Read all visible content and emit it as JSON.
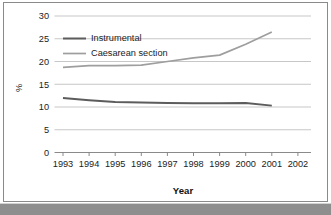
{
  "chart_data": {
    "type": "line",
    "title": "",
    "xlabel": "Year",
    "ylabel": "%",
    "x": [
      1993,
      1994,
      1995,
      1996,
      1997,
      1998,
      1999,
      2000,
      2001
    ],
    "xtick_labels": [
      "1993",
      "1994",
      "1995",
      "1996",
      "1997",
      "1998",
      "1999",
      "2000",
      "2001",
      "2002"
    ],
    "xlim": [
      1993,
      2002
    ],
    "ytick_labels": [
      "0",
      "5",
      "10",
      "15",
      "20",
      "25",
      "30"
    ],
    "yticks": [
      0,
      5,
      10,
      15,
      20,
      25,
      30
    ],
    "ylim": [
      0,
      30
    ],
    "grid": "horizontal",
    "legend_position": "upper-left-inside",
    "series": [
      {
        "name": "Instrumental",
        "color": "#5c5c5c",
        "values": [
          12.0,
          11.5,
          11.1,
          11.0,
          10.9,
          10.8,
          10.8,
          10.9,
          10.3
        ]
      },
      {
        "name": "Caesarean section",
        "color": "#9e9e9e",
        "values": [
          18.7,
          19.1,
          19.1,
          19.2,
          20.0,
          20.8,
          21.4,
          23.8,
          26.5
        ]
      }
    ]
  },
  "legend": {
    "items": [
      {
        "label": "Instrumental"
      },
      {
        "label": "Caesarean section"
      }
    ]
  },
  "axes": {
    "y_axis_label": "%",
    "x_axis_label": "Year"
  }
}
